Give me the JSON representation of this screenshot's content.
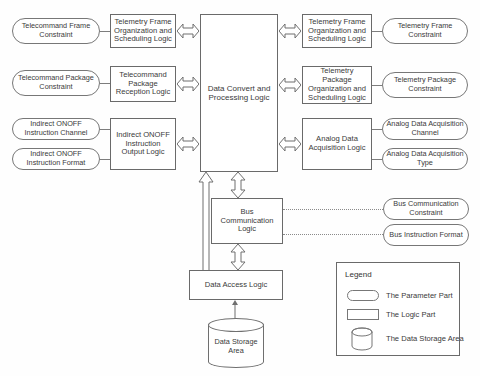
{
  "diagram": {
    "type": "block-diagram",
    "stroke_color": "#6a6a6a",
    "text_color": "#3a3a3a",
    "background": "#ffffff"
  },
  "center": {
    "label": "Data Convert and Processing Logic"
  },
  "left_logic": [
    {
      "label": "Telemetry Frame Organization and Scheduling Logic"
    },
    {
      "label": "Telecommand Package Reception Logic"
    },
    {
      "label": "Indirect ONOFF Instruction Output Logic"
    }
  ],
  "left_params": [
    {
      "label": "Telecommand Frame Constraint"
    },
    {
      "label": "Telecommand Package Constraint"
    },
    {
      "label": "Indirect ONOFF Instruction Channel"
    },
    {
      "label": "Indirect ONOFF Instruction Format"
    }
  ],
  "right_logic": [
    {
      "label": "Telemetry Frame Organization and Scheduling Logic"
    },
    {
      "label": "Telemetry Package Organization and Scheduling Logic"
    },
    {
      "label": "Analog Data Acquisition Logic"
    }
  ],
  "right_params": [
    {
      "label": "Telemetry Frame Constraint"
    },
    {
      "label": "Telemetry Package Constraint"
    },
    {
      "label": "Analog Data Acquisition Channel"
    },
    {
      "label": "Analog Data Acquisition Type"
    }
  ],
  "bus": {
    "logic_label": "Bus Communication Logic",
    "params": [
      {
        "label": "Bus Communication Constraint"
      },
      {
        "label": "Bus Instruction Format"
      }
    ]
  },
  "storage": {
    "access_label": "Data Access Logic",
    "area_label": "Data Storage Area"
  },
  "legend": {
    "title": "Legend",
    "items": [
      {
        "shape": "pill",
        "label": "The Parameter Part"
      },
      {
        "shape": "rect",
        "label": "The Logic Part"
      },
      {
        "shape": "cylinder",
        "label": "The Data Storage Area"
      }
    ]
  }
}
